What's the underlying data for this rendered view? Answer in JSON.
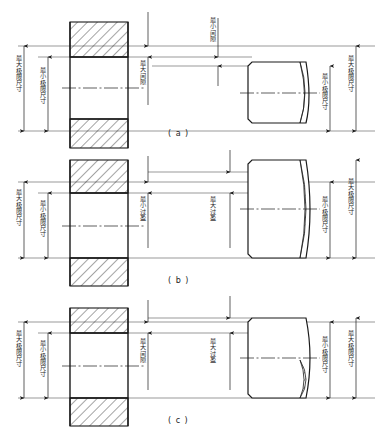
{
  "figure": {
    "background_color": "#ffffff",
    "line_color": "#1a1a1a",
    "thin_line_color": "#555555",
    "width": 380,
    "height": 444
  },
  "panels": [
    {
      "id": "a",
      "caption": "( a )",
      "fit_type": "间隙配合",
      "hole_labels": {
        "max_limit": "最大极限尺寸",
        "min_limit": "最小极限尺寸"
      },
      "gap_labels": [
        {
          "name": "max-clearance",
          "text": "最大间隙"
        },
        {
          "name": "min-clearance",
          "text": "最小间隙"
        }
      ],
      "shaft_labels": {
        "min_limit": "最小极限尺寸",
        "max_limit": "最大极限尺寸"
      }
    },
    {
      "id": "b",
      "caption": "( b )",
      "fit_type": "过盈配合",
      "hole_labels": {
        "max_limit": "最大极限尺寸",
        "min_limit": "最小极限尺寸"
      },
      "gap_labels": [
        {
          "name": "min-interference",
          "text": "最小过盈"
        },
        {
          "name": "max-interference",
          "text": "最大过盈"
        }
      ],
      "shaft_labels": {
        "min_limit": "最小极限尺寸",
        "max_limit": "最大极限尺寸"
      }
    },
    {
      "id": "c",
      "caption": "( c )",
      "fit_type": "过渡配合",
      "hole_labels": {
        "max_limit": "最大极限尺寸",
        "min_limit": "最小极限尺寸"
      },
      "gap_labels": [
        {
          "name": "max-clearance",
          "text": "最大间隙"
        },
        {
          "name": "max-interference",
          "text": "最大过盈"
        }
      ],
      "shaft_labels": {
        "min_limit": "最小极限尺寸",
        "max_limit": "最大极限尺寸"
      }
    }
  ]
}
